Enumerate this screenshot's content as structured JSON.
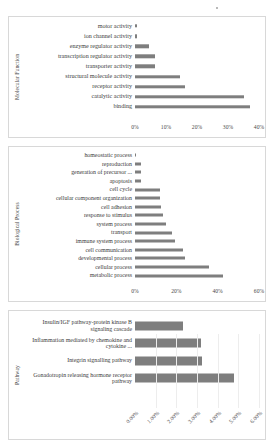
{
  "chart_data": [
    {
      "type": "bar",
      "title": "Molecular Function",
      "orientation": "horizontal",
      "ylabel": "Molecular Function",
      "xlabel": "",
      "xlim": [
        0,
        40
      ],
      "xticks": [
        "0%",
        "10%",
        "20%",
        "30%",
        "40%"
      ],
      "xtick_values": [
        0,
        10,
        20,
        30,
        40
      ],
      "grid": false,
      "bar_color": "#7e7e7e",
      "categories": [
        "motor activity",
        "ion channel activity",
        "enzyme regulator activity",
        "transcription regulator activity",
        "transporter activity",
        "structural molecule activity",
        "receptor activity",
        "catalytic activity",
        "binding"
      ],
      "values": [
        0.5,
        0.5,
        4.5,
        6.5,
        6.5,
        14.5,
        16.0,
        35.0,
        37.0
      ]
    },
    {
      "type": "bar",
      "title": "Biological Process",
      "orientation": "horizontal",
      "ylabel": "Biological Process",
      "xlabel": "",
      "xlim": [
        0,
        60
      ],
      "xticks": [
        "0%",
        "20%",
        "40%",
        "60%"
      ],
      "xtick_values": [
        0,
        20,
        40,
        60
      ],
      "grid": false,
      "bar_color": "#7e7e7e",
      "categories": [
        "homeostatic process",
        "reproduction",
        "generation of precursor ...",
        "apoptosis",
        "cell cycle",
        "cellular component organization",
        "cell adhesion",
        "response to stimulus",
        "system process",
        "transport",
        "immune system process",
        "cell communication",
        "developmental process",
        "cellular process",
        "metabolic process"
      ],
      "values": [
        0.5,
        3.0,
        3.0,
        3.0,
        12.0,
        12.0,
        12.5,
        13.5,
        15.0,
        18.0,
        19.5,
        23.0,
        24.0,
        36.0,
        42.5
      ]
    },
    {
      "type": "bar",
      "title": "Pathway",
      "orientation": "horizontal",
      "ylabel": "Pathway",
      "xlabel": "",
      "xlim": [
        0,
        6
      ],
      "xticks": [
        "0.00%",
        "1.00%",
        "2.00%",
        "3.00%",
        "4.00%",
        "5.00%",
        "6.00%"
      ],
      "xtick_values": [
        0,
        1,
        2,
        3,
        4,
        5,
        6
      ],
      "grid": true,
      "bar_color": "#7e7e7e",
      "categories": [
        "Insulin/IGF pathway-protein kinase B signaling cascade",
        "Inflammation mediated by chemokine and cytokine ...",
        "Integrin signalling pathway",
        "Gonadotropin releasing hormone receptor pathway"
      ],
      "values": [
        2.3,
        3.2,
        3.25,
        4.8
      ]
    }
  ]
}
